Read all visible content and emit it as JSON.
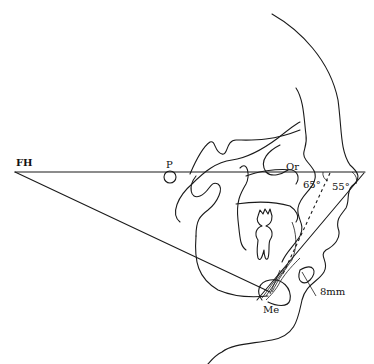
{
  "figure": {
    "type": "cephalometric tracing",
    "labels": {
      "fh": "FH",
      "porion": "P",
      "orbitale": "Or",
      "menton": "Me",
      "angle_1": "65°",
      "angle_2": "55°",
      "distance": "8mm"
    },
    "colors": {
      "line": "#1a1a1a",
      "background": "#ffffff"
    }
  }
}
